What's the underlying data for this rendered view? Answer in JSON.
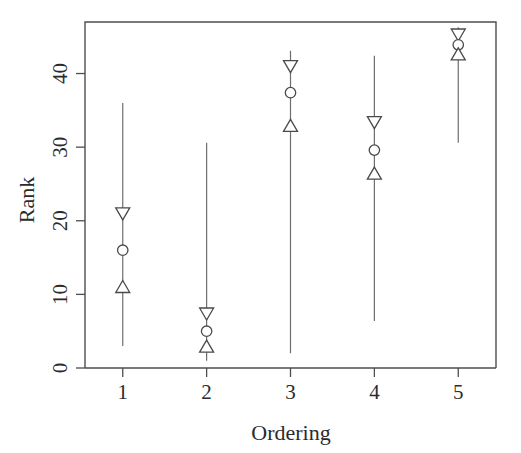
{
  "chart_data": {
    "type": "scatter",
    "title": "",
    "subtitle": "",
    "xlabel": "Ordering",
    "ylabel": "Rank",
    "categories": [
      "1",
      "2",
      "3",
      "4",
      "5"
    ],
    "x": [
      1,
      2,
      3,
      4,
      5
    ],
    "xlim": [
      0.55,
      5.45
    ],
    "ylim": [
      0,
      47
    ],
    "xticks": [
      1,
      2,
      3,
      4,
      5
    ],
    "xtick_labels": [
      "1",
      "2",
      "3",
      "4",
      "5"
    ],
    "yticks": [
      0,
      10,
      20,
      30,
      40
    ],
    "ytick_labels": [
      "0",
      "10",
      "20",
      "30",
      "40"
    ],
    "grid": false,
    "legend": "none",
    "series": [
      {
        "name": "upper-marker",
        "marker": "triangle-down",
        "values": [
          21.0,
          7.4,
          41.0,
          33.4,
          45.3
        ]
      },
      {
        "name": "center-marker",
        "marker": "circle",
        "values": [
          16.0,
          5.0,
          37.4,
          29.6,
          43.9
        ]
      },
      {
        "name": "lower-marker",
        "marker": "triangle-up",
        "values": [
          11.0,
          2.9,
          32.9,
          26.4,
          42.6
        ]
      }
    ],
    "intervals": [
      {
        "x": 1,
        "low": 3.0,
        "high": 36.0
      },
      {
        "x": 2,
        "low": 1.0,
        "high": 30.6
      },
      {
        "x": 3,
        "low": 2.0,
        "high": 43.1
      },
      {
        "x": 4,
        "low": 6.4,
        "high": 42.4
      },
      {
        "x": 5,
        "low": 30.6,
        "high": 46.3
      }
    ],
    "colors": {
      "axis": "#4d4d4d",
      "marker_stroke": "#4a4a4a",
      "marker_fill": "#ffffff",
      "interval_line": "#6e6e6e",
      "text": "#2b2b2b",
      "background": "#ffffff"
    }
  }
}
